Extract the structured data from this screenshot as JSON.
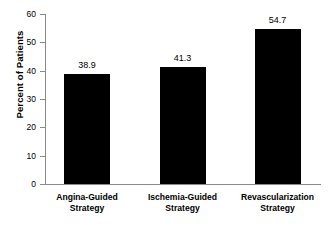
{
  "chart_data": {
    "type": "bar",
    "title": "",
    "subtitle": "",
    "xlabel": "",
    "ylabel": "Percent of Patients",
    "categories": [
      "Angina-Guided Strategy",
      "Ischemia-Guided Strategy",
      "Revascularization Strategy"
    ],
    "category_lines": [
      [
        "Angina-Guided",
        "Strategy"
      ],
      [
        "Ischemia-Guided",
        "Strategy"
      ],
      [
        "Revascularization",
        "Strategy"
      ]
    ],
    "values": [
      38.9,
      41.3,
      54.7
    ],
    "value_labels": [
      "38.9",
      "41.3",
      "54.7"
    ],
    "ylim": [
      0,
      60
    ],
    "ytick_values": [
      0,
      10,
      20,
      30,
      40,
      50,
      60
    ],
    "ytick_labels": [
      "0",
      "10",
      "20",
      "30",
      "40",
      "50",
      "60"
    ],
    "grid": false,
    "legend": false,
    "legend_position": "none",
    "bar_color": "#000000",
    "axis_color": "#8a8a8a",
    "text_color": "#000000",
    "background_color": "#ffffff"
  }
}
